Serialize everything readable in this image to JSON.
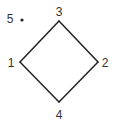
{
  "diagram": {
    "type": "graph",
    "stroke_color": "#222222",
    "label_color": "#333333",
    "vertices": [
      {
        "id": "1",
        "label": "1",
        "x": 20,
        "y": 62,
        "label_x": 11,
        "label_y": 63
      },
      {
        "id": "2",
        "label": "2",
        "x": 98,
        "y": 62,
        "label_x": 105,
        "label_y": 63
      },
      {
        "id": "3",
        "label": "3",
        "x": 59,
        "y": 21,
        "label_x": 59,
        "label_y": 12
      },
      {
        "id": "4",
        "label": "4",
        "x": 59,
        "y": 102,
        "label_x": 59,
        "label_y": 115
      },
      {
        "id": "5",
        "label": "5",
        "x": 22,
        "y": 20,
        "label_x": 10,
        "label_y": 19,
        "isolated": true
      }
    ],
    "edges": [
      {
        "from": "1",
        "to": "3"
      },
      {
        "from": "3",
        "to": "2"
      },
      {
        "from": "2",
        "to": "4"
      },
      {
        "from": "4",
        "to": "1"
      }
    ]
  }
}
